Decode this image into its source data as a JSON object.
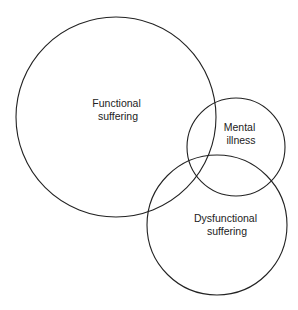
{
  "diagram": {
    "type": "venn",
    "stroke_color": "#222222",
    "background": "#ffffff",
    "sets": [
      {
        "id": "functional",
        "line1": "Functional",
        "line2": "suffering",
        "cx": 116,
        "cy": 117,
        "r": 100,
        "lx": 118,
        "ly": 110
      },
      {
        "id": "mental",
        "line1": "Mental",
        "line2": "illness",
        "cx": 236,
        "cy": 147,
        "r": 49,
        "lx": 241,
        "ly": 133
      },
      {
        "id": "dysfunctional",
        "line1": "Dysfunctional",
        "line2": "suffering",
        "cx": 217,
        "cy": 225,
        "r": 70,
        "lx": 227,
        "ly": 224
      }
    ]
  }
}
